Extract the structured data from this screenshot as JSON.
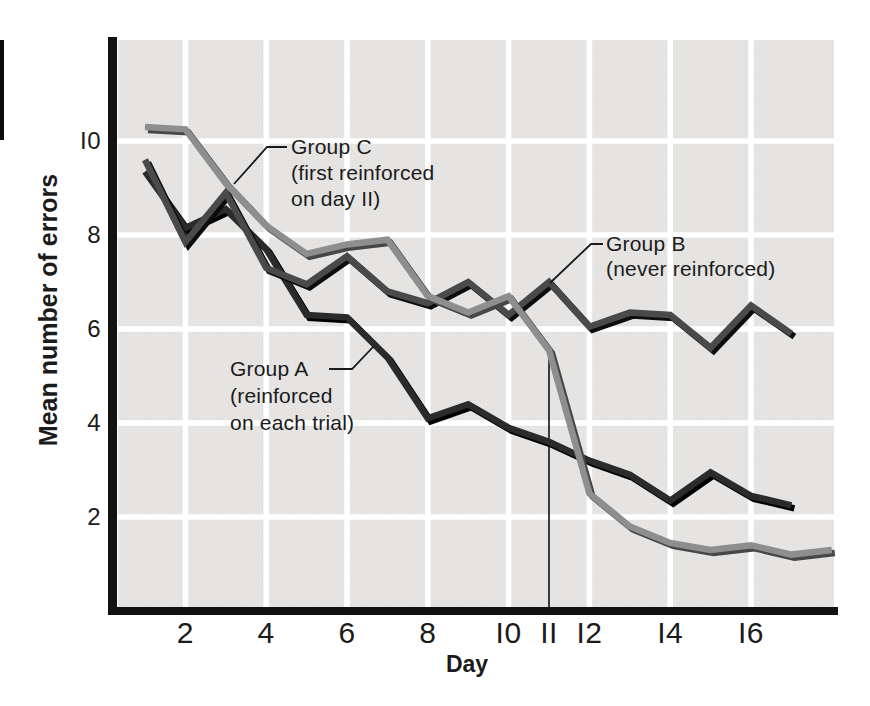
{
  "colors": {
    "page_bg": "#ffffff",
    "plot_bg": "#e6e5e3",
    "plot_dot": "#dbdad8",
    "grid": "#ffffff",
    "axis": "#121212",
    "text": "#1b1b1b",
    "pointer_line": "#1a1a1a",
    "day11_line": "#111111",
    "edge_artifact": "#0b0b0b"
  },
  "chart_data": {
    "type": "line",
    "title": "",
    "xlabel": "Day",
    "ylabel": "Mean number of errors",
    "xlim": [
      0.35,
      18.1
    ],
    "ylim": [
      0,
      12.15
    ],
    "grid": "on, white gridlines over light-gray plot area",
    "legend_position": "none (inline annotations with pointer lines)",
    "x_ticks": [
      2,
      4,
      6,
      8,
      10,
      11,
      12,
      14,
      16
    ],
    "y_ticks": [
      2,
      4,
      6,
      8,
      10
    ],
    "x_gridlines": [
      2,
      4,
      6,
      8,
      10,
      12,
      14,
      16
    ],
    "y_gridlines": [
      2,
      4,
      6,
      8,
      10
    ],
    "day11_line": {
      "x": 11,
      "top_value": 5.55,
      "note": "thin vertical marker from x-axis up to Group C curve at day 11"
    },
    "series": [
      {
        "id": "group-a",
        "name": "Group A",
        "description": "reinforced on each trial",
        "color": "#2b2b2b",
        "shadow_color": "#000000",
        "days": [
          1,
          2,
          3,
          4,
          5,
          6,
          7,
          8,
          9,
          10,
          11,
          12,
          13,
          14,
          15,
          16,
          17
        ],
        "values": [
          9.35,
          8.15,
          8.55,
          7.7,
          6.3,
          6.25,
          5.4,
          4.1,
          4.4,
          3.9,
          3.6,
          3.2,
          2.9,
          2.35,
          2.95,
          2.45,
          2.25
        ],
        "annotation": {
          "lines": [
            "Group A",
            "(reinforced",
            "on each trial)"
          ],
          "x": 230,
          "y": 369,
          "line_height": 27,
          "pointer": [
            [
              329,
              369
            ],
            [
              352,
              369
            ],
            [
              374,
              346
            ]
          ]
        }
      },
      {
        "id": "group-b",
        "name": "Group B",
        "description": "never reinforced",
        "color": "#4a4a4a",
        "shadow_color": "#0d0d0d",
        "days": [
          1,
          2,
          3,
          4,
          5,
          6,
          7,
          8,
          9,
          10,
          11,
          12,
          13,
          14,
          15,
          16,
          17
        ],
        "values": [
          9.6,
          7.85,
          8.9,
          7.3,
          6.95,
          7.55,
          6.8,
          6.55,
          7.0,
          6.3,
          7.0,
          6.05,
          6.35,
          6.3,
          5.6,
          6.5,
          5.9
        ],
        "annotation": {
          "lines": [
            "Group B",
            "(never reinforced)"
          ],
          "x": 606,
          "y": 244,
          "line_height": 25,
          "pointer": [
            [
              603,
              244
            ],
            [
              591,
              244
            ],
            [
              550,
              283
            ]
          ]
        }
      },
      {
        "id": "group-c",
        "name": "Group C",
        "description": "first reinforced on day 11",
        "color": "#8e8e8e",
        "shadow_color": "#474747",
        "days": [
          1,
          2,
          3,
          4,
          5,
          6,
          7,
          8,
          9,
          10,
          11,
          12,
          13,
          14,
          15,
          16,
          17,
          18
        ],
        "values": [
          10.3,
          10.25,
          9.1,
          8.2,
          7.6,
          7.8,
          7.9,
          6.7,
          6.35,
          6.7,
          5.55,
          2.5,
          1.8,
          1.45,
          1.3,
          1.4,
          1.2,
          1.3
        ],
        "annotation": {
          "lines": [
            "Group C",
            "(first reinforced",
            "on day 11)"
          ],
          "x": 291,
          "y": 147,
          "line_height": 26,
          "pointer": [
            [
              287,
              147
            ],
            [
              267,
              147
            ],
            [
              234,
              184
            ]
          ]
        }
      }
    ]
  }
}
